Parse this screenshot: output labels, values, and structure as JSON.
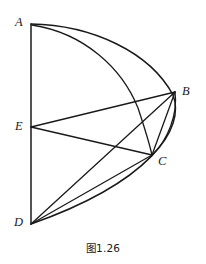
{
  "figure": {
    "caption": "图1.26",
    "stroke_color": "#1a1a1a",
    "background_color": "#ffffff",
    "vertices": [
      {
        "id": "A",
        "label": "A",
        "x": 31,
        "y": 24
      },
      {
        "id": "B",
        "label": "B",
        "x": 175,
        "y": 92
      },
      {
        "id": "C",
        "label": "C",
        "x": 152,
        "y": 155
      },
      {
        "id": "D",
        "label": "D",
        "x": 31,
        "y": 224
      },
      {
        "id": "E",
        "label": "E",
        "x": 31,
        "y": 127
      }
    ],
    "label_positions": [
      {
        "id": "A",
        "left": 15,
        "top": 16
      },
      {
        "id": "B",
        "left": 182,
        "top": 85
      },
      {
        "id": "C",
        "left": 158,
        "top": 155
      },
      {
        "id": "D",
        "left": 14,
        "top": 216
      },
      {
        "id": "E",
        "left": 15,
        "top": 120
      }
    ],
    "segments": [
      {
        "name": "segment-AD",
        "from": "A",
        "to": "D"
      },
      {
        "name": "segment-EB",
        "from": "E",
        "to": "B"
      },
      {
        "name": "segment-EC",
        "from": "E",
        "to": "C"
      },
      {
        "name": "segment-BC",
        "from": "B",
        "to": "C"
      },
      {
        "name": "segment-BD",
        "from": "B",
        "to": "D"
      },
      {
        "name": "segment-CD",
        "from": "C",
        "to": "D"
      }
    ],
    "arcs": [
      {
        "name": "arc-A-B-D",
        "from": "A",
        "to": "D",
        "through": "B",
        "description": "outer quarter arc centred at D from A through B down to D"
      },
      {
        "name": "arc-A-C",
        "from": "A",
        "to": "C",
        "description": "inner arc from A curving right and down to C"
      },
      {
        "name": "arc-B-C",
        "from": "B",
        "to": "C",
        "description": "short arc bulging right between B and C"
      }
    ]
  }
}
